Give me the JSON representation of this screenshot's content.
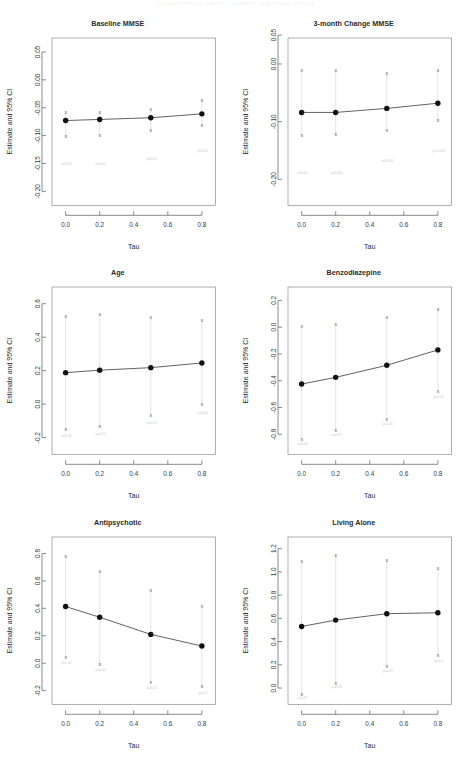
{
  "header": {
    "text": "Supplementary Figure : quantile regression results"
  },
  "figure": {
    "shared_xlabel": "Tau",
    "shared_ylabel": "Estimate and 95% CI",
    "x_ticks": [
      "0.0",
      "0.2",
      "0.4",
      "0.6",
      "0.8"
    ],
    "x_tick_values": [
      0.0,
      0.2,
      0.4,
      0.6,
      0.8
    ],
    "tau_values": [
      0.0,
      0.2,
      0.5,
      0.8
    ],
    "marker": "x",
    "point_symbol": "filled-circle"
  },
  "chart_data": [
    {
      "type": "line",
      "id": "baseline-mmse",
      "title": "Baseline MMSE",
      "xlabel": "Tau",
      "ylabel": "Estimate and 95% CI",
      "x": [
        0.0,
        0.2,
        0.5,
        0.8
      ],
      "xlim": [
        -0.08,
        0.88
      ],
      "ylim": [
        -0.225,
        0.075
      ],
      "y_ticks": [
        0.05,
        0.0,
        -0.05,
        -0.1,
        -0.15,
        -0.2
      ],
      "y_tick_labels": [
        "0.05",
        "0.00",
        "-0.05",
        "-0.10",
        "-0.15",
        "-0.20"
      ],
      "series": [
        {
          "name": "estimate",
          "values": [
            -0.073,
            -0.071,
            -0.068,
            -0.061
          ]
        },
        {
          "name": "ci_lower",
          "values": [
            -0.102,
            -0.1,
            -0.091,
            -0.082
          ]
        },
        {
          "name": "ci_upper",
          "values": [
            -0.059,
            -0.059,
            -0.054,
            -0.037
          ]
        }
      ],
      "annotations": [
        "p<0.01",
        "p<0.01",
        "p<0.01",
        "p<0.01"
      ],
      "annotation_y": [
        -0.152,
        -0.152,
        -0.143,
        -0.13
      ]
    },
    {
      "type": "line",
      "id": "three-month-change-mmse",
      "title": "3-month Change MMSE",
      "xlabel": "Tau",
      "ylabel": "Estimate and 95% CI",
      "x": [
        0.0,
        0.2,
        0.5,
        0.8
      ],
      "xlim": [
        -0.08,
        0.88
      ],
      "ylim": [
        -0.245,
        0.045
      ],
      "y_ticks": [
        0.05,
        0.0,
        -0.1,
        -0.2
      ],
      "y_tick_labels": [
        "0.05",
        "0.00",
        "-0.10",
        "-0.20"
      ],
      "series": [
        {
          "name": "estimate",
          "values": [
            -0.084,
            -0.084,
            -0.077,
            -0.068
          ]
        },
        {
          "name": "ci_lower",
          "values": [
            -0.124,
            -0.123,
            -0.115,
            -0.099
          ]
        },
        {
          "name": "ci_upper",
          "values": [
            -0.012,
            -0.012,
            -0.016,
            -0.011
          ]
        }
      ],
      "annotations": [
        "p<0.01",
        "p<0.001",
        "p<0.001",
        "p<0.001"
      ],
      "annotation_y": [
        -0.19,
        -0.19,
        -0.17,
        -0.152
      ]
    },
    {
      "type": "line",
      "id": "age",
      "title": "Age",
      "xlabel": "Tau",
      "ylabel": "Estimate and 95% CI",
      "x": [
        0.0,
        0.2,
        0.5,
        0.8
      ],
      "xlim": [
        -0.08,
        0.88
      ],
      "ylim": [
        -0.3,
        0.7
      ],
      "y_ticks": [
        0.6,
        0.4,
        0.2,
        0.0,
        -0.2
      ],
      "y_tick_labels": [
        "0.6",
        "0.4",
        "0.2",
        "0.0",
        "-0.2"
      ],
      "series": [
        {
          "name": "estimate",
          "values": [
            0.188,
            0.203,
            0.218,
            0.246
          ]
        },
        {
          "name": "ci_lower",
          "values": [
            -0.155,
            -0.136,
            -0.072,
            -0.005
          ]
        },
        {
          "name": "ci_upper",
          "values": [
            0.525,
            0.535,
            0.515,
            0.5
          ]
        }
      ],
      "annotations": [
        "p=0.26",
        "p=0.22",
        "p=0.15",
        "p=0.06"
      ],
      "annotation_y": [
        -0.198,
        -0.183,
        -0.12,
        -0.06
      ]
    },
    {
      "type": "line",
      "id": "benzodiazepine",
      "title": "Benzodiazepine",
      "xlabel": "Tau",
      "ylabel": "Estimate and 95% CI",
      "x": [
        0.0,
        0.2,
        0.5,
        0.8
      ],
      "xlim": [
        -0.08,
        0.88
      ],
      "ylim": [
        -0.95,
        0.3
      ],
      "y_ticks": [
        0.2,
        0.0,
        -0.2,
        -0.4,
        -0.6,
        -0.8
      ],
      "y_tick_labels": [
        "0.2",
        "0.0",
        "-0.2",
        "-0.4",
        "-0.6",
        "-0.8"
      ],
      "series": [
        {
          "name": "estimate",
          "values": [
            -0.425,
            -0.375,
            -0.285,
            -0.17
          ]
        },
        {
          "name": "ci_lower",
          "values": [
            -0.84,
            -0.775,
            -0.69,
            -0.48
          ]
        },
        {
          "name": "ci_upper",
          "values": [
            0.0,
            0.02,
            0.07,
            0.13
          ]
        }
      ],
      "annotations": [
        "p=0.06",
        "p=0.07",
        "p=0.11",
        "p=0.22"
      ],
      "annotation_y": [
        -0.88,
        -0.812,
        -0.732,
        -0.53
      ]
    },
    {
      "type": "line",
      "id": "antipsychotic",
      "title": "Antipsychotic",
      "xlabel": "Tau",
      "ylabel": "Estimate and 95% CI",
      "x": [
        0.0,
        0.2,
        0.5,
        0.8
      ],
      "xlim": [
        -0.08,
        0.88
      ],
      "ylim": [
        -0.3,
        0.92
      ],
      "y_ticks": [
        0.8,
        0.6,
        0.4,
        0.2,
        0.0,
        -0.2
      ],
      "y_tick_labels": [
        "0.8",
        "0.6",
        "0.4",
        "0.2",
        "0.0",
        "-0.2"
      ],
      "series": [
        {
          "name": "estimate",
          "values": [
            0.413,
            0.335,
            0.21,
            0.125
          ]
        },
        {
          "name": "ci_lower",
          "values": [
            0.04,
            -0.01,
            -0.14,
            -0.175
          ]
        },
        {
          "name": "ci_upper",
          "values": [
            0.775,
            0.67,
            0.525,
            0.41
          ]
        }
      ],
      "annotations": [
        "p=0.02",
        "p=0.04",
        "p=0.15",
        "p=0.4"
      ],
      "annotation_y": [
        -0.005,
        -0.06,
        -0.19,
        -0.228
      ]
    },
    {
      "type": "line",
      "id": "living-alone",
      "title": "Living Alone",
      "xlabel": "Tau",
      "ylabel": "Estimate and 95% CI",
      "x": [
        0.0,
        0.2,
        0.5,
        0.8
      ],
      "xlim": [
        -0.08,
        0.88
      ],
      "ylim": [
        -0.14,
        1.3
      ],
      "y_ticks": [
        1.2,
        1.0,
        0.8,
        0.6,
        0.4,
        0.2,
        0.0
      ],
      "y_tick_labels": [
        "1.2",
        "1.0",
        "0.8",
        "0.6",
        "0.4",
        "0.2",
        "0.0"
      ],
      "series": [
        {
          "name": "estimate",
          "values": [
            0.53,
            0.585,
            0.64,
            0.648
          ]
        },
        {
          "name": "ci_lower",
          "values": [
            -0.055,
            0.04,
            0.185,
            0.275
          ]
        },
        {
          "name": "ci_upper",
          "values": [
            1.09,
            1.135,
            1.1,
            1.025
          ]
        }
      ],
      "annotations": [
        "p=0.07",
        "p=0.03",
        "p=0.05",
        "p=0.1"
      ],
      "annotation_y": [
        -0.095,
        0.0,
        0.14,
        0.222
      ]
    }
  ]
}
